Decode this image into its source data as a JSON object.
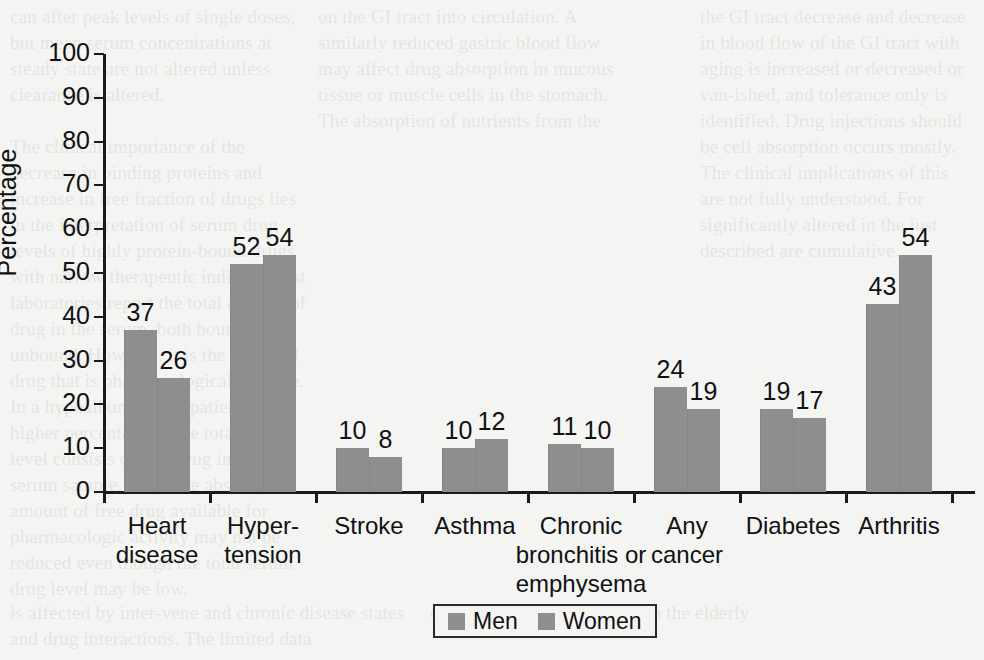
{
  "page": {
    "background_color": "#f4f4f2",
    "bleed_text": {
      "left": "can after peak levels of single doses, but mean serum concentrations at steady state are not altered unless clearance is altered.\n\nThe clinical importance of the decrease in binding proteins and increase in free fraction of drugs lies in the interpretation of serum drug levels of highly protein-bound drugs with narrow therapeutic indices. Most laboratories report the total amount of drug in the serum, both bound and unbound. However, it is the unbound drug that is pharmacologically active. In a hypoalbuminemic patient, a higher percentage of the total drug level consists of free drug in a given serum sample. Thus, the absolute amount of free drug available for pharmacologic activity may not be reduced even though the total serum drug level may be low.",
      "middle": "on the GI tract into circulation. A similarly reduced gastric blood flow may affect drug absorption in mucous tissue or muscle cells in the stomach. The absorption of nutrients from the",
      "right": "the GI tract decrease and decrease in blood flow of the GI tract with aging is increased or decreased or van-ished, and tolerance only is identified. Drug injections should be cell absorption occurs mostly. The clinical implications of this are not fully understood. For significantly altered in the just described are cumulative.",
      "bottom_left": "is affected by inter-vene and chronic disease states and drug interactions. The limited data",
      "bottom_right": "on absorption of oral drugs in the elderly"
    }
  },
  "chart_data": {
    "type": "bar",
    "title": "",
    "xlabel": "",
    "ylabel": "Percentage",
    "ylim": [
      0,
      100
    ],
    "yticks": [
      0,
      10,
      20,
      30,
      40,
      50,
      60,
      70,
      80,
      90,
      100
    ],
    "ytick_labels": [
      "0",
      "10",
      "20",
      "30",
      "40",
      "50",
      "60",
      "70",
      "80",
      "90",
      "100"
    ],
    "grid": false,
    "legend_position": "bottom-center",
    "bar_color": "#8e8e8e",
    "categories": [
      "Heart\ndisease",
      "Hyper-\ntension",
      "Stroke",
      "Asthma",
      "Chronic\nbronchitis or\nemphysema",
      "Any\ncancer",
      "Diabetes",
      "Arthritis"
    ],
    "category_lines": [
      [
        "Heart",
        "disease"
      ],
      [
        "Hyper-",
        "tension"
      ],
      [
        "Stroke"
      ],
      [
        "Asthma"
      ],
      [
        "Chronic",
        "bronchitis or",
        "emphysema"
      ],
      [
        "Any",
        "cancer"
      ],
      [
        "Diabetes"
      ],
      [
        "Arthritis"
      ]
    ],
    "series": [
      {
        "name": "Men",
        "values": [
          37,
          52,
          10,
          10,
          11,
          24,
          19,
          43
        ]
      },
      {
        "name": "Women",
        "values": [
          26,
          54,
          8,
          12,
          10,
          19,
          17,
          54
        ]
      }
    ],
    "legend": [
      "Men",
      "Women"
    ]
  }
}
